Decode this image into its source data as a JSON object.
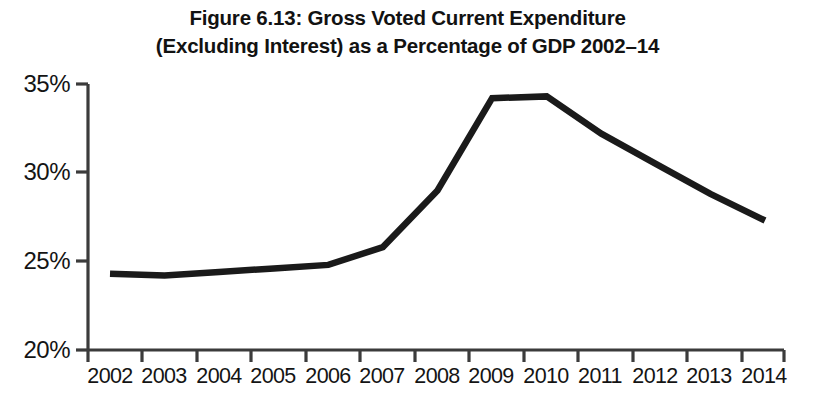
{
  "figure": {
    "title_lines": [
      "Figure 6.13: Gross Voted Current Expenditure",
      "(Excluding Interest) as a Percentage of GDP 2002–14"
    ],
    "line_color": "#1a1a1a",
    "axis_color": "#3b3b3b",
    "background": "#ffffff"
  },
  "chart_data": {
    "type": "line",
    "title": "Figure 6.13: Gross Voted Current Expenditure (Excluding Interest) as a Percentage of GDP 2002–14",
    "xlabel": "",
    "ylabel": "",
    "categories": [
      "2002",
      "2003",
      "2004",
      "2005",
      "2006",
      "2007",
      "2008",
      "2009",
      "2010",
      "2011",
      "2012",
      "2013",
      "2014"
    ],
    "values": [
      24.3,
      24.2,
      24.4,
      24.6,
      24.8,
      25.8,
      29.0,
      34.2,
      34.3,
      32.2,
      30.5,
      28.8,
      27.3
    ],
    "series": [
      {
        "name": "Gross Voted Current Expenditure (Excluding Interest) as % of GDP",
        "values": [
          24.3,
          24.2,
          24.4,
          24.6,
          24.8,
          25.8,
          29.0,
          34.2,
          34.3,
          32.2,
          30.5,
          28.8,
          27.3
        ]
      }
    ],
    "ylim": [
      20,
      35
    ],
    "xlim": [
      "2002",
      "2014"
    ],
    "ytick_values": [
      20,
      25,
      30,
      35
    ],
    "ytick_labels": [
      "20%",
      "25%",
      "30%",
      "35%"
    ],
    "xtick_labels": [
      "2002",
      "2003",
      "2004",
      "2005",
      "2006",
      "2007",
      "2008",
      "2009",
      "2010",
      "2011",
      "2012",
      "2013",
      "2014"
    ],
    "grid": false,
    "legend": false,
    "legend_position": "none",
    "markers": false,
    "annotations": []
  }
}
